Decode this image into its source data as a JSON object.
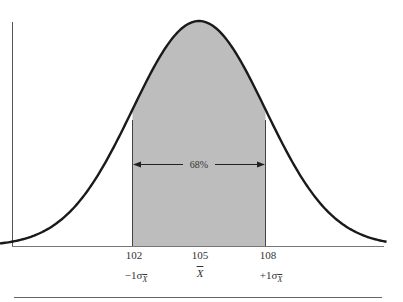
{
  "chart_data": {
    "type": "area",
    "title": "",
    "distribution": "normal",
    "mean": 105,
    "std_error": 3,
    "x_ticks": [
      102,
      105,
      108
    ],
    "x_tick_labels": [
      "102",
      "105",
      "108"
    ],
    "sigma_labels": [
      "-1σX̄",
      "X̄",
      "+1σX̄"
    ],
    "shaded_region": {
      "from": 102,
      "to": 108,
      "label": "68%"
    },
    "xlabel": "",
    "ylabel": "",
    "grid": false,
    "colors": {
      "curve": "#1a1a1a",
      "shade": "#bdbdbd",
      "axis": "#555555",
      "rule": "#666666"
    }
  },
  "labels": {
    "tick_102": "102",
    "tick_105": "105",
    "tick_108": "108",
    "percent": "68%",
    "minus_sigma_prefix": "−1σ",
    "plus_sigma_prefix": "+1σ",
    "sigma_sub": "X",
    "mean_symbol": "X"
  }
}
